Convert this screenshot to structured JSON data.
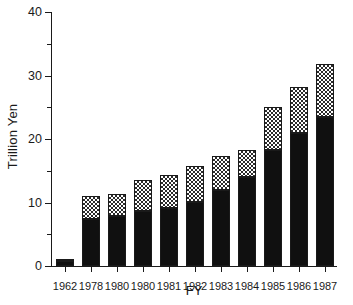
{
  "chart_data": {
    "type": "bar",
    "title": "",
    "xlabel": "FY",
    "ylabel": "Trillion Yen",
    "ylim": [
      0,
      40
    ],
    "ytick_labels": [
      "0",
      "10",
      "20",
      "30",
      "40"
    ],
    "ytick_values": [
      0,
      10,
      20,
      30,
      40
    ],
    "yminor_values": [
      5,
      15,
      25,
      35
    ],
    "grid": false,
    "legend": "none",
    "stacked": true,
    "categories": [
      "1962",
      "1978",
      "1980",
      "1980",
      "1981",
      "1982",
      "1983",
      "1984",
      "1985",
      "1986",
      "1987"
    ],
    "series": [
      {
        "name": "lower-segment",
        "fill": "solid-black",
        "values": [
          0.8,
          7.4,
          7.8,
          8.6,
          9.2,
          10.1,
          12.0,
          14.0,
          18.2,
          21.0,
          23.5
        ]
      },
      {
        "name": "upper-segment",
        "fill": "checkered-hatch",
        "values": [
          0.3,
          3.6,
          3.5,
          4.9,
          5.1,
          5.7,
          5.3,
          4.2,
          6.8,
          7.2,
          8.3
        ]
      }
    ],
    "totals": [
      1.1,
      11.0,
      11.3,
      13.5,
      14.3,
      15.8,
      17.3,
      18.2,
      25.0,
      28.2,
      31.8
    ]
  },
  "colors": {
    "axis": "#1a1a1a",
    "lower_segment": "#101010",
    "upper_segment_bg": "#ffffff",
    "upper_segment_fg": "#2b2b2b",
    "background": "#ffffff"
  }
}
